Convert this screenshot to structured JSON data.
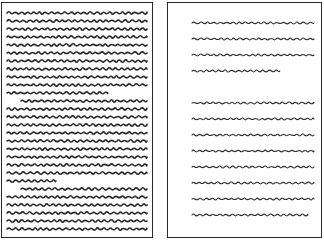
{
  "figure": {
    "stroke_color": "#2a2a2a",
    "left_page": {
      "name": "dense-page",
      "line_spacing": 8,
      "line_thickness": 1.6,
      "paragraphs": [
        {
          "indent": false,
          "lines": [
            1,
            1,
            1,
            1,
            1,
            1,
            1,
            1,
            1,
            1,
            0.72
          ]
        },
        {
          "indent": true,
          "lines": [
            1,
            1,
            1,
            1,
            1,
            1,
            1,
            1,
            1,
            1,
            0.35
          ]
        },
        {
          "indent": true,
          "lines": [
            1,
            1,
            1,
            1,
            1,
            1
          ]
        }
      ]
    },
    "right_page": {
      "name": "sparse-page",
      "line_spacing": 16,
      "line_thickness": 1.1,
      "paragraphs": [
        {
          "indent": false,
          "lines": [
            1,
            1,
            1,
            0.72
          ]
        },
        {
          "indent": false,
          "lines": [
            1,
            1,
            1,
            1,
            1,
            1,
            1,
            0.95
          ]
        }
      ]
    }
  }
}
